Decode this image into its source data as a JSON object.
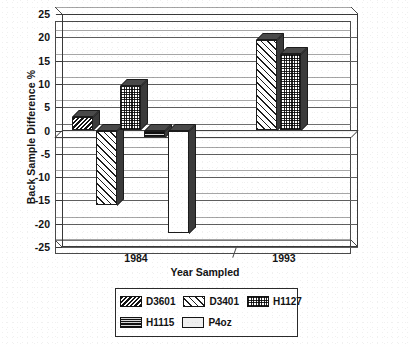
{
  "chart_data": {
    "type": "bar",
    "title": "",
    "subtitle": "",
    "xlabel": "Year Sampled",
    "ylabel": "Back Sample Difference  %",
    "categories": [
      "1984",
      "1993"
    ],
    "ylim": [
      -25,
      25
    ],
    "yticks": [
      25,
      20,
      15,
      10,
      5,
      0,
      -5,
      -10,
      -15,
      -20,
      -25
    ],
    "ytick_labels": [
      "25",
      "20",
      "15",
      "10",
      "5",
      "0",
      "-5",
      "-10",
      "-15",
      "-20",
      "-25"
    ],
    "grid": true,
    "legend_position": "bottom",
    "style": "3d-column",
    "series": [
      {
        "name": "D3601",
        "pattern": "dense-diagonal-hatch",
        "values": [
          3,
          null
        ]
      },
      {
        "name": "D3401",
        "pattern": "light-diagonal-hatch",
        "values": [
          -16,
          19.5
        ]
      },
      {
        "name": "H1127",
        "pattern": "checkered",
        "values": [
          9.5,
          16.5
        ]
      },
      {
        "name": "H1115",
        "pattern": "dark-horizontal-lines",
        "values": [
          -1.5,
          null
        ]
      },
      {
        "name": "P4oz",
        "pattern": "solid-white",
        "values": [
          -22,
          null
        ]
      }
    ],
    "annotations": []
  },
  "axes": {
    "y_title": "Back Sample Difference  %",
    "x_title": "Year Sampled",
    "y_ticks": [
      {
        "label": "25",
        "value": 25
      },
      {
        "label": "20",
        "value": 20
      },
      {
        "label": "15",
        "value": 15
      },
      {
        "label": "10",
        "value": 10
      },
      {
        "label": "5",
        "value": 5
      },
      {
        "label": "0",
        "value": 0
      },
      {
        "label": "-5",
        "value": -5
      },
      {
        "label": "-10",
        "value": -10
      },
      {
        "label": "-15",
        "value": -15
      },
      {
        "label": "-20",
        "value": -20
      },
      {
        "label": "-25",
        "value": -25
      }
    ],
    "x_categories": [
      {
        "label": "1984"
      },
      {
        "label": "1993"
      }
    ]
  },
  "legend": {
    "row1": [
      {
        "label": "D3601",
        "pattern": "dense-diagonal-hatch"
      },
      {
        "label": "D3401",
        "pattern": "light-diagonal-hatch"
      },
      {
        "label": "H1127",
        "pattern": "checkered"
      }
    ],
    "row2": [
      {
        "label": "H1115",
        "pattern": "dark-horizontal-lines"
      },
      {
        "label": "P4oz",
        "pattern": "solid-white"
      }
    ]
  },
  "colors": {
    "ink": "#1a1a1a",
    "grid": "#5f5f5f",
    "frame": "#3a3a3a",
    "background": "#ffffff",
    "bar_side": "#3b3b3b"
  }
}
